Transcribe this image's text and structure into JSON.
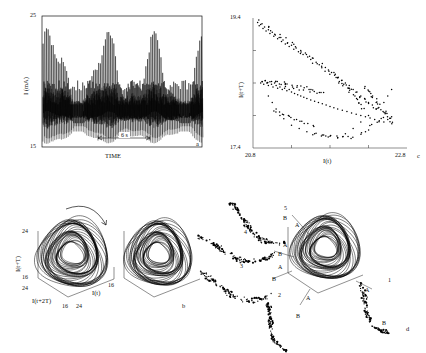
{
  "figure": {
    "panels": [
      "a",
      "b",
      "c",
      "d"
    ]
  },
  "panel_a": {
    "letter": "a",
    "ylabel": "I (mA)",
    "xlabel": "TIME",
    "ytop": "25",
    "ybottom": "15",
    "scalebar_label": "6 s"
  },
  "panel_c": {
    "letter": "c",
    "ylabel": "I(t+T)",
    "xlabel": "I(t)",
    "ytop": "19.4",
    "ybottom": "17.4",
    "xleft": "20.8",
    "xright": "22.8"
  },
  "panel_b": {
    "letter": "b",
    "ylabel": "I(t+T)",
    "xlabel_left": "I(t+2T)",
    "xlabel_right": "I(t)",
    "ytop": "24",
    "ybottom": "16",
    "left_far": "24",
    "left_near": "16",
    "right_near": "24",
    "right_far": "16"
  },
  "panel_d": {
    "letter": "d",
    "section_labels": [
      "1",
      "2",
      "3",
      "4",
      "5"
    ],
    "point_labels": [
      "A",
      "B"
    ]
  },
  "chart_data": [
    {
      "type": "line",
      "id": "a",
      "title": "",
      "xlabel": "TIME",
      "ylabel": "I (mA)",
      "ylim": [
        15,
        25
      ],
      "yticks": [
        15,
        25
      ],
      "grid": false,
      "annotation": "6 s",
      "series": [
        {
          "name": "current timeseries",
          "note": "chaotic relaxation oscillation, ~95 spikes, amplitude modulated",
          "n_points": 2400
        }
      ]
    },
    {
      "type": "scatter",
      "id": "c",
      "title": "",
      "xlabel": "I(t)",
      "ylabel": "I(t+T)",
      "xlim": [
        20.8,
        22.8
      ],
      "ylim": [
        17.4,
        19.4
      ],
      "xticks": [
        20.8,
        22.8
      ],
      "yticks": [
        17.4,
        19.4
      ],
      "grid": false,
      "x": [
        20.86,
        20.88,
        20.9,
        20.93,
        20.95,
        20.97,
        21.0,
        21.02,
        21.05,
        21.07,
        21.09,
        21.12,
        21.14,
        21.17,
        21.19,
        21.22,
        21.25,
        21.27,
        21.3,
        21.33,
        21.36,
        21.39,
        21.42,
        21.45,
        21.48,
        21.51,
        21.55,
        21.58,
        21.62,
        21.66,
        21.7,
        21.74,
        21.78,
        21.82,
        21.86,
        21.9,
        21.95,
        22.0,
        22.05,
        22.1,
        22.15,
        22.2,
        22.25,
        22.3,
        22.35,
        22.4,
        20.9,
        20.92,
        20.94,
        20.96,
        20.98,
        21.0,
        21.02,
        21.04,
        21.06,
        21.08,
        21.1,
        21.12,
        21.15,
        21.18,
        21.21,
        21.24,
        21.27,
        21.3,
        21.34,
        21.38,
        21.42,
        21.46,
        21.5,
        21.55,
        21.6,
        21.65,
        21.7,
        21.75,
        21.8,
        21.85,
        21.9,
        21.96,
        22.02,
        22.08,
        22.14,
        22.2,
        22.26,
        22.32,
        22.38,
        22.44,
        22.5,
        22.55,
        22.6,
        21.0,
        21.05,
        21.1,
        21.15,
        21.2,
        21.3,
        21.4,
        21.5,
        21.6,
        21.7,
        21.8,
        21.9,
        22.0,
        22.1,
        22.2,
        22.3,
        22.4,
        22.5,
        22.55,
        22.6
      ],
      "y": [
        19.33,
        19.28,
        19.3,
        19.24,
        19.26,
        19.2,
        19.22,
        19.16,
        19.18,
        19.12,
        19.14,
        19.08,
        19.1,
        19.04,
        19.06,
        19.0,
        19.02,
        18.96,
        18.98,
        18.92,
        18.94,
        18.88,
        18.9,
        18.84,
        18.86,
        18.8,
        18.76,
        18.78,
        18.72,
        18.68,
        18.7,
        18.64,
        18.6,
        18.56,
        18.52,
        18.48,
        18.44,
        18.4,
        18.36,
        18.3,
        18.26,
        18.2,
        18.16,
        18.1,
        18.06,
        18.0,
        18.4,
        18.42,
        18.38,
        18.44,
        18.4,
        18.36,
        18.42,
        18.38,
        18.34,
        18.4,
        18.36,
        18.32,
        18.34,
        18.3,
        18.32,
        18.28,
        18.3,
        18.26,
        18.24,
        18.22,
        18.2,
        18.18,
        18.16,
        18.14,
        18.12,
        18.1,
        18.08,
        18.06,
        18.04,
        18.02,
        18.0,
        17.98,
        17.96,
        17.94,
        17.92,
        17.9,
        17.88,
        17.86,
        17.84,
        17.82,
        17.8,
        17.84,
        17.88,
        18.2,
        18.1,
        18.0,
        17.9,
        17.85,
        17.75,
        17.7,
        17.65,
        17.62,
        17.6,
        17.58,
        17.56,
        17.62,
        17.7,
        17.8,
        17.9,
        18.0,
        18.1,
        18.2,
        18.3
      ]
    },
    {
      "type": "scatter",
      "id": "b",
      "title": "",
      "xlabel_left": "I(t+2T)",
      "xlabel_right": "I(t)",
      "ylabel": "I(t+T)",
      "ylim": [
        16,
        24
      ],
      "projection": "3d",
      "note": "two 3D phase-space attractor reconstructions, dense banded toroidal chaotic attractor"
    },
    {
      "type": "scatter",
      "id": "d",
      "title": "",
      "projection": "3d",
      "note": "3D attractor with five Poincare sections labeled 1-5, each exploded outward showing fractal point sets with A and B branch markers"
    }
  ]
}
